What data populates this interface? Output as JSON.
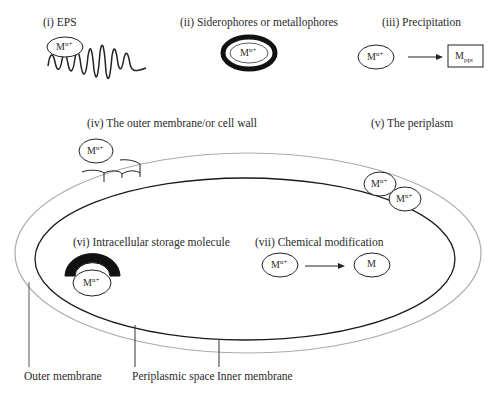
{
  "panels": {
    "eps": {
      "label": "(i) EPS",
      "ion": "M",
      "charge": "n+"
    },
    "siderophores": {
      "label": "(ii) Siderophores or metallophores",
      "ion": "M",
      "charge": "n+"
    },
    "precipitation": {
      "label": "(iii) Precipitation",
      "ion": "M",
      "charge": "n+",
      "product": "M",
      "product_sub": "ppt"
    },
    "outer_membrane": {
      "label": "(iv) The outer membrane/or cell wall",
      "ion": "M",
      "charge": "n+"
    },
    "periplasm": {
      "label": "(v) The periplasm",
      "ion": "M",
      "charge": "n+"
    },
    "storage": {
      "label": "(vi) Intracellular storage molecule",
      "ion": "M",
      "charge": "n+"
    },
    "chemical": {
      "label": "(vii) Chemical modification",
      "ion": "M",
      "charge": "n+",
      "product": "M"
    }
  },
  "callouts": {
    "outer": "Outer membrane",
    "periplasmic": "Periplasmic space",
    "inner": "Inner membrane"
  },
  "colors": {
    "outer_membrane": "#aaaaaa",
    "inner_membrane": "#1a1a1a",
    "text": "#2a2a2a"
  }
}
